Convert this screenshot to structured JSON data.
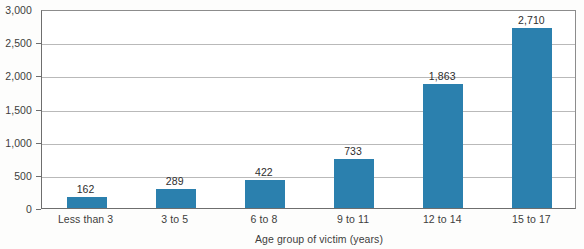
{
  "chart_data": {
    "type": "bar",
    "title": "",
    "subtitle": "",
    "xlabel": "Age group of victim (years)",
    "ylabel": "",
    "categories": [
      "Less than 3",
      "3 to 5",
      "6 to 8",
      "9 to 11",
      "12 to 14",
      "15 to 17"
    ],
    "values": [
      162,
      289,
      422,
      733,
      1863,
      2710
    ],
    "value_labels": [
      "162",
      "289",
      "422",
      "733",
      "1,863",
      "2,710"
    ],
    "ylim": [
      0,
      3000
    ],
    "ytick_values": [
      0,
      500,
      1000,
      1500,
      2000,
      2500,
      3000
    ],
    "ytick_labels": [
      "0",
      "500",
      "1,000",
      "1,500",
      "2,000",
      "2,500",
      "3,000"
    ],
    "grid": true,
    "legend": false,
    "legend_position": "none",
    "series": [
      {
        "name": "Victims",
        "values": [
          162,
          289,
          422,
          733,
          1863,
          2710
        ]
      }
    ],
    "colors": {
      "bar": "#2b80ae",
      "gridline": "#b9b9b9",
      "axis": "#6e6e6e",
      "text": "#3d3d3d",
      "background": "#ffffff"
    }
  }
}
